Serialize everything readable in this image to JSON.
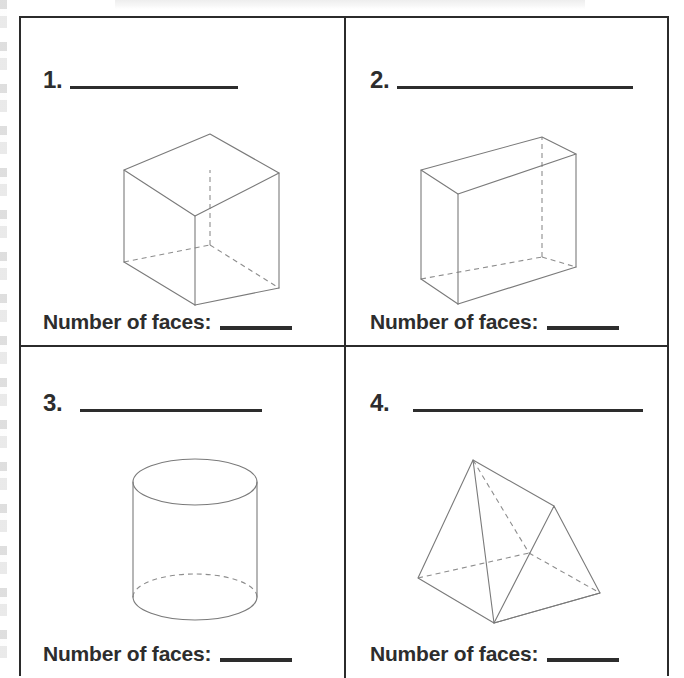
{
  "document": {
    "type": "math-worksheet",
    "topic": "Identify 3D solid figures and count faces",
    "page_background": "#ffffff",
    "ink_color": "#2d2d2d",
    "figure_line_color": "#7a7a7a"
  },
  "grid": {
    "columns": 2,
    "rows": 2,
    "border_color": "#2b2b2b"
  },
  "questions": [
    {
      "number": "1.",
      "answer_line_width": 168,
      "figure": {
        "name": "cube",
        "icon": "cube-wireframe-icon",
        "description": "Wireframe cube drawn in oblique/isometric view with hidden back edges dashed",
        "faces": 6,
        "edges": 12,
        "vertices": 8
      },
      "footer_label": "Number of faces:",
      "footer_answer": ""
    },
    {
      "number": "2.",
      "answer_line_width": 236,
      "figure": {
        "name": "rectangular-prism",
        "icon": "rectangular-prism-wireframe-icon",
        "description": "Wireframe rectangular prism (cuboid) wider than deep, hidden back edges dashed",
        "faces": 6,
        "edges": 12,
        "vertices": 8
      },
      "footer_label": "Number of faces:",
      "footer_answer": ""
    },
    {
      "number": "3.",
      "answer_line_width": 182,
      "figure": {
        "name": "cylinder",
        "icon": "cylinder-wireframe-icon",
        "description": "Wireframe cylinder, full top ellipse, bottom ellipse with dashed hidden back arc",
        "faces": 3,
        "edges": 2,
        "vertices": 0
      },
      "footer_label": "Number of faces:",
      "footer_answer": ""
    },
    {
      "number": "4.",
      "answer_line_width": 230,
      "figure": {
        "name": "triangular-prism",
        "icon": "triangular-prism-wireframe-icon",
        "description": "Wireframe triangular prism lying on a rectangular base, hidden back edges dashed",
        "faces": 5,
        "edges": 9,
        "vertices": 6
      },
      "footer_label": "Number of faces:",
      "footer_answer": ""
    }
  ]
}
